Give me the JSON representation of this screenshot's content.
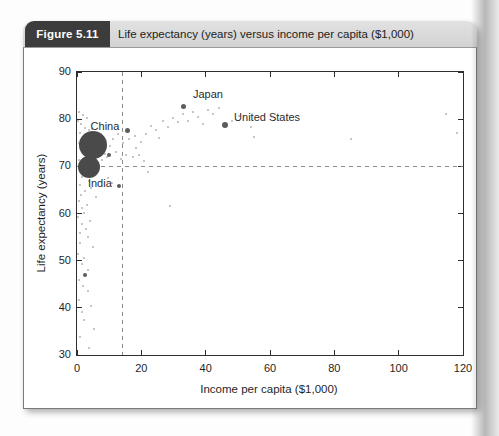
{
  "figure": {
    "label": "Figure 5.11",
    "title": "Life expectancy (years) versus income per capita ($1,000)"
  },
  "colors": {
    "header_box_bg": "#3c3c3c",
    "header_box_text": "#ffffff",
    "title_strip_bg": "#d6d6d6",
    "title_text": "#1d1d1d",
    "axis_color": "#2e2e2e",
    "background_dot": "#a6a6a6",
    "accent_dot": "#5c5c5c",
    "bubble": "#4a4a4a",
    "dashed_line": "#8c8c8c"
  },
  "chart_data": {
    "type": "scatter",
    "xlabel": "Income per capita ($1,000)",
    "ylabel": "Life expectancy (years)",
    "xlim": [
      0,
      120
    ],
    "ylim": [
      30,
      90
    ],
    "xticks": [
      0,
      20,
      40,
      60,
      80,
      100,
      120
    ],
    "yticks": [
      30,
      40,
      50,
      60,
      70,
      80,
      90
    ],
    "grid": false,
    "reference_lines": [
      {
        "orientation": "vertical",
        "x": 14,
        "style": "dashed"
      },
      {
        "orientation": "horizontal",
        "y": 70,
        "style": "dashed"
      }
    ],
    "bubbles": [
      {
        "name": "China",
        "x": 5.1,
        "y": 74.5,
        "d_px": 28,
        "label": "China",
        "label_x": 8.7,
        "label_y": 78.6
      },
      {
        "name": "India",
        "x": 3.8,
        "y": 69.9,
        "d_px": 22,
        "label": "India",
        "label_x": 7.1,
        "label_y": 66.5
      }
    ],
    "labeled_points": [
      {
        "name": "Japan",
        "x": 33.0,
        "y": 82.6,
        "d_px": 5,
        "label": "Japan",
        "label_x": 40.7,
        "label_y": 85.3
      },
      {
        "name": "United States",
        "x": 46.0,
        "y": 78.7,
        "d_px": 6,
        "label": "United States",
        "label_x": 59.1,
        "label_y": 80.5
      }
    ],
    "accent_points": [
      {
        "x": 15.7,
        "y": 77.6,
        "d_px": 5
      },
      {
        "x": 10.0,
        "y": 72.5,
        "d_px": 4
      },
      {
        "x": 13.1,
        "y": 65.8,
        "d_px": 4
      },
      {
        "x": 2.5,
        "y": 47.0,
        "d_px": 4
      }
    ],
    "background_points": [
      [
        0.6,
        81.6
      ],
      [
        1.9,
        80.9
      ],
      [
        3.1,
        80.3
      ],
      [
        0.4,
        79.6
      ],
      [
        1.2,
        78.9
      ],
      [
        2.4,
        78.2
      ],
      [
        3.6,
        77.6
      ],
      [
        1.0,
        77.0
      ],
      [
        4.8,
        77.9
      ],
      [
        5.9,
        76.6
      ],
      [
        7.1,
        75.3
      ],
      [
        2.0,
        75.9
      ],
      [
        0.7,
        74.9
      ],
      [
        1.5,
        73.9
      ],
      [
        6.6,
        72.1
      ],
      [
        7.7,
        71.3
      ],
      [
        8.6,
        72.7
      ],
      [
        9.3,
        71.9
      ],
      [
        0.5,
        71.3
      ],
      [
        1.3,
        70.4
      ],
      [
        5.1,
        69.4
      ],
      [
        2.9,
        68.6
      ],
      [
        1.7,
        67.7
      ],
      [
        3.7,
        66.9
      ],
      [
        0.9,
        66.1
      ],
      [
        4.3,
        65.4
      ],
      [
        2.5,
        64.7
      ],
      [
        1.1,
        63.9
      ],
      [
        5.9,
        63.4
      ],
      [
        0.6,
        62.7
      ],
      [
        3.2,
        61.9
      ],
      [
        1.6,
        61.1
      ],
      [
        2.1,
        60.2
      ],
      [
        0.4,
        59.3
      ],
      [
        4.1,
        58.5
      ],
      [
        1.4,
        57.7
      ],
      [
        2.7,
        56.8
      ],
      [
        0.8,
        55.9
      ],
      [
        3.5,
        55.1
      ],
      [
        1.0,
        53.8
      ],
      [
        4.9,
        52.9
      ],
      [
        0.3,
        51.5
      ],
      [
        2.1,
        50.6
      ],
      [
        1.4,
        49.2
      ],
      [
        3.3,
        48.1
      ],
      [
        0.6,
        45.8
      ],
      [
        2.0,
        44.6
      ],
      [
        3.4,
        43.5
      ],
      [
        0.7,
        41.7
      ],
      [
        4.3,
        40.3
      ],
      [
        1.5,
        39.2
      ],
      [
        2.3,
        37.5
      ],
      [
        5.4,
        35.5
      ],
      [
        1.0,
        33.8
      ],
      [
        3.8,
        31.5
      ],
      [
        9.6,
        67.6
      ],
      [
        11.0,
        66.4
      ],
      [
        10.4,
        74.3
      ],
      [
        11.2,
        75.7
      ],
      [
        12.0,
        73.1
      ],
      [
        12.9,
        76.9
      ],
      [
        13.6,
        71.6
      ],
      [
        14.3,
        74.9
      ],
      [
        15.1,
        72.4
      ],
      [
        16.2,
        75.9
      ],
      [
        17.3,
        71.9
      ],
      [
        18.1,
        76.4
      ],
      [
        18.4,
        73.9
      ],
      [
        19.3,
        72.5
      ],
      [
        20.0,
        75.1
      ],
      [
        20.9,
        71.2
      ],
      [
        21.5,
        76.9
      ],
      [
        22.1,
        68.7
      ],
      [
        23.1,
        78.5
      ],
      [
        24.6,
        77.6
      ],
      [
        25.4,
        76.0
      ],
      [
        26.7,
        79.7
      ],
      [
        28.2,
        78.3
      ],
      [
        28.8,
        61.6
      ],
      [
        29.8,
        80.3
      ],
      [
        31.4,
        79.3
      ],
      [
        32.9,
        81.1
      ],
      [
        34.5,
        79.7
      ],
      [
        36.0,
        81.5
      ],
      [
        37.6,
        80.4
      ],
      [
        39.1,
        78.9
      ],
      [
        40.7,
        81.9
      ],
      [
        42.3,
        81.0
      ],
      [
        44.1,
        82.3
      ],
      [
        48.1,
        79.6
      ],
      [
        50.3,
        80.7
      ],
      [
        54.1,
        78.3
      ],
      [
        55.0,
        76.2
      ],
      [
        85.2,
        75.8
      ],
      [
        114.6,
        81.0
      ],
      [
        118.1,
        77.1
      ]
    ]
  }
}
